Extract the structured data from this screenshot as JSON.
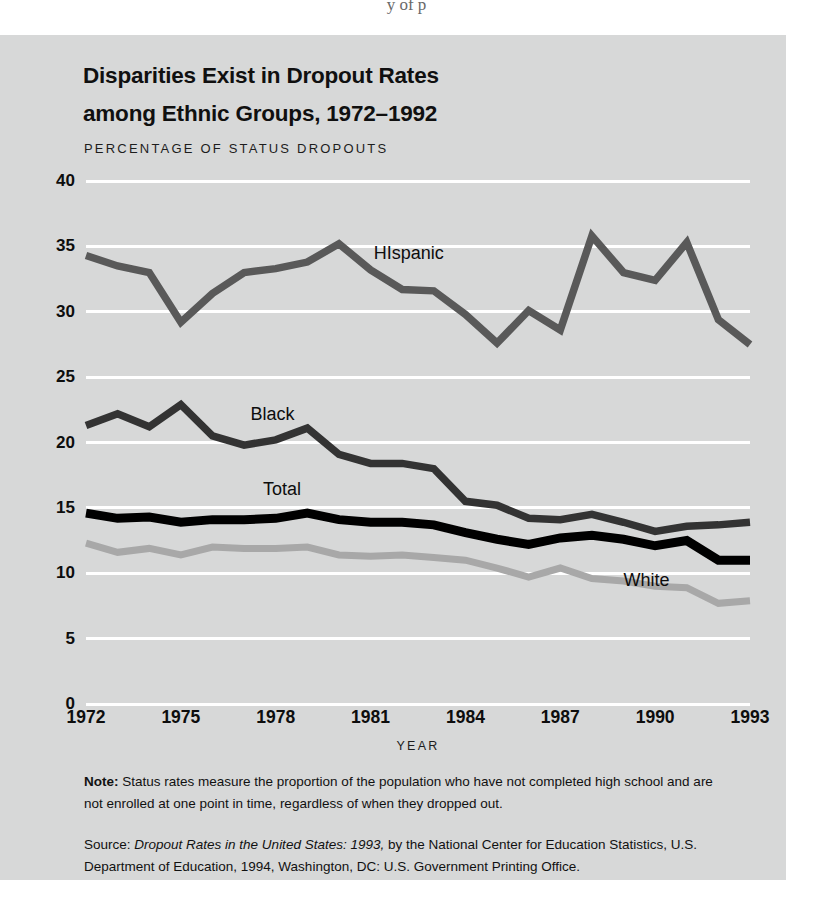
{
  "page_fragment": "y  of  p",
  "figure": {
    "title_line1": "Disparities Exist in Dropout Rates",
    "title_line2": "among Ethnic Groups, 1972–1992",
    "axis_note": "PERCENTAGE OF STATUS DROPOUTS",
    "xaxis_title": "YEAR",
    "note_label": "Note:",
    "note_text": " Status rates measure the proportion of the population who have not completed high school and are not enrolled at one point in time, regardless of when they dropped out.",
    "source_label": "Source:",
    "source_title": "Dropout Rates in the United States: 1993,",
    "source_rest": " by the National Center for Education Statistics, U.S. Department of Education, 1994, Washington, DC: U.S. Government Printing Office.",
    "colors": {
      "panel_background": "#d7d8d8",
      "gridline": "#ffffff",
      "hispanic": "#595959",
      "black": "#333333",
      "total": "#000000",
      "white": "#a8a8a8",
      "text": "#0d0d0d"
    }
  },
  "chart_data": {
    "type": "line",
    "title": "Disparities Exist in Dropout Rates among Ethnic Groups, 1972–1992",
    "xlabel": "YEAR",
    "ylabel": "PERCENTAGE OF STATUS DROPOUTS",
    "xlim": [
      1972,
      1993
    ],
    "ylim": [
      0,
      40
    ],
    "ytick_values": [
      0,
      5,
      10,
      15,
      20,
      25,
      30,
      35,
      40
    ],
    "ytick_labels": [
      "0",
      "5",
      "10",
      "15",
      "20",
      "25",
      "30",
      "35",
      "40"
    ],
    "xtick_values": [
      1972,
      1975,
      1978,
      1981,
      1984,
      1987,
      1990,
      1993
    ],
    "xtick_labels": [
      "1972",
      "1975",
      "1978",
      "1981",
      "1984",
      "1987",
      "1990",
      "1993"
    ],
    "grid": true,
    "legend": "inline-labels",
    "x": [
      1972,
      1973,
      1974,
      1975,
      1976,
      1977,
      1978,
      1979,
      1980,
      1981,
      1982,
      1983,
      1984,
      1985,
      1986,
      1987,
      1988,
      1989,
      1990,
      1991,
      1992,
      1993
    ],
    "series": [
      {
        "name": "HIspanic",
        "label": "HIspanic",
        "color": "#595959",
        "label_x": 1981.1,
        "label_y": 34.4,
        "values": [
          34.3,
          33.5,
          33.0,
          29.2,
          31.4,
          33.0,
          33.3,
          33.8,
          35.2,
          33.2,
          31.7,
          31.6,
          29.8,
          27.6,
          30.1,
          28.6,
          35.8,
          33.0,
          32.4,
          35.3,
          29.4,
          27.5
        ]
      },
      {
        "name": "Black",
        "label": "Black",
        "color": "#333333",
        "label_x": 1977.2,
        "label_y": 22.1,
        "values": [
          21.3,
          22.2,
          21.2,
          22.9,
          20.5,
          19.8,
          20.2,
          21.1,
          19.1,
          18.4,
          18.4,
          18.0,
          15.5,
          15.2,
          14.2,
          14.1,
          14.5,
          13.9,
          13.2,
          13.6,
          13.7,
          13.9
        ]
      },
      {
        "name": "Total",
        "label": "Total",
        "color": "#000000",
        "label_x": 1977.6,
        "label_y": 16.4,
        "values": [
          14.6,
          14.2,
          14.3,
          13.9,
          14.1,
          14.1,
          14.2,
          14.6,
          14.1,
          13.9,
          13.9,
          13.7,
          13.1,
          12.6,
          12.2,
          12.7,
          12.9,
          12.6,
          12.1,
          12.5,
          11.0,
          11.0
        ]
      },
      {
        "name": "White",
        "label": "White",
        "color": "#a8a8a8",
        "label_x": 1989.0,
        "label_y": 9.4,
        "values": [
          12.3,
          11.6,
          11.9,
          11.4,
          12.0,
          11.9,
          11.9,
          12.0,
          11.4,
          11.3,
          11.4,
          11.2,
          11.0,
          10.4,
          9.7,
          10.4,
          9.6,
          9.4,
          9.0,
          8.9,
          7.7,
          7.9
        ]
      }
    ]
  }
}
